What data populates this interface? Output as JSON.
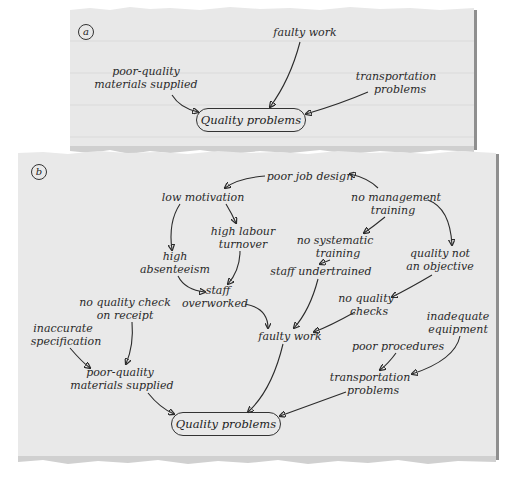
{
  "panel_a": {
    "tag": "a",
    "nodes": {
      "faulty_work": "faulty work",
      "poor_quality_1": "poor-quality",
      "poor_quality_2": "materials supplied",
      "transportation_1": "transportation",
      "transportation_2": "problems",
      "quality_problems": "Quality problems"
    }
  },
  "panel_b": {
    "tag": "b",
    "nodes": {
      "poor_job_design": "poor job design",
      "low_motivation": "low motivation",
      "no_mgmt_1": "no management",
      "no_mgmt_2": "training",
      "high_labour_1": "high labour",
      "high_labour_2": "turnover",
      "high_abs_1": "high",
      "high_abs_2": "absenteeism",
      "no_systematic_1": "no systematic",
      "no_systematic_2": "training",
      "quality_not_1": "quality not",
      "quality_not_2": "an objective",
      "staff_undertrained": "staff undertrained",
      "staff_overworked_1": "staff",
      "staff_overworked_2": "overworked",
      "no_quality_checks_1": "no quality",
      "no_quality_checks_2": "checks",
      "no_quality_check_receipt_1": "no quality check",
      "no_quality_check_receipt_2": "on receipt",
      "inaccurate_1": "inaccurate",
      "inaccurate_2": "specification",
      "inadequate_1": "inadequate",
      "inadequate_2": "equipment",
      "faulty_work": "faulty work",
      "poor_procedures": "poor procedures",
      "poor_quality_1": "poor-quality",
      "poor_quality_2": "materials supplied",
      "transportation_1": "transportation",
      "transportation_2": "problems",
      "quality_problems": "Quality problems"
    }
  },
  "colors": {
    "paper": "#e9e9e9",
    "ink": "#2a2a2a",
    "shadow": "#8f8f8f"
  }
}
